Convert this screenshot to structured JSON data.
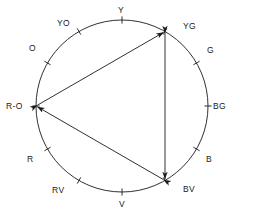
{
  "diagram": {
    "type": "color-wheel",
    "circle": {
      "cx": 122,
      "cy": 106,
      "r": 86,
      "stroke": "#1a1a1a",
      "stroke_width": 0.9
    },
    "hue_labels": [
      {
        "key": "Y",
        "text": "Y",
        "angle_deg": 90,
        "lx": 118,
        "ly": 6,
        "tick": true
      },
      {
        "key": "YG",
        "text": "YG",
        "angle_deg": 60,
        "lx": 183,
        "ly": 22,
        "tick": true
      },
      {
        "key": "G",
        "text": "G",
        "angle_deg": 30,
        "lx": 207,
        "ly": 46,
        "tick": true
      },
      {
        "key": "BG",
        "text": "BG",
        "angle_deg": 0,
        "lx": 213,
        "ly": 102,
        "tick": true
      },
      {
        "key": "B",
        "text": "B",
        "angle_deg": -30,
        "lx": 206,
        "ly": 155,
        "tick": true
      },
      {
        "key": "BV",
        "text": "BV",
        "angle_deg": -60,
        "lx": 183,
        "ly": 185,
        "tick": true
      },
      {
        "key": "V",
        "text": "V",
        "angle_deg": -90,
        "lx": 119,
        "ly": 200,
        "tick": true
      },
      {
        "key": "RV",
        "text": "RV",
        "angle_deg": -120,
        "lx": 52,
        "ly": 186,
        "tick": true
      },
      {
        "key": "R",
        "text": "R",
        "angle_deg": -150,
        "lx": 27,
        "ly": 155,
        "tick": true
      },
      {
        "key": "R-O",
        "text": "R-O",
        "angle_deg": 180,
        "lx": 6,
        "ly": 102,
        "tick": true
      },
      {
        "key": "O",
        "text": "O",
        "angle_deg": 150,
        "lx": 29,
        "ly": 44,
        "tick": true
      },
      {
        "key": "YO",
        "text": "YO",
        "angle_deg": 120,
        "lx": 57,
        "ly": 19,
        "tick": true
      }
    ],
    "triangle": {
      "vertices": [
        "R-O",
        "YG",
        "BV"
      ],
      "stroke": "#1a1a1a",
      "stroke_width": 0.9,
      "arrowheads": "double",
      "edges": [
        {
          "from": "R-O",
          "to": "YG"
        },
        {
          "from": "YG",
          "to": "BV"
        },
        {
          "from": "BV",
          "to": "R-O"
        }
      ]
    },
    "colors": {
      "ink": "#1a1a1a",
      "paper": "#ffffff"
    }
  }
}
